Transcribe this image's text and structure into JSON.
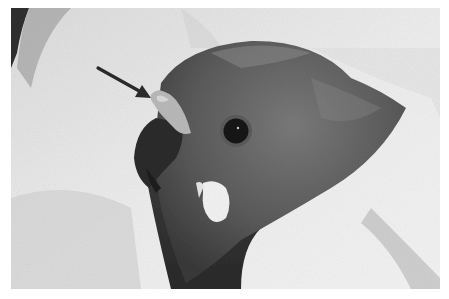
{
  "image": {
    "kind": "photograph",
    "tone": "grayscale",
    "subject": "parrot head wrapped in towel",
    "annotation": {
      "type": "arrow",
      "points_to": "cere-lesion",
      "color": "#2a2a2a"
    }
  },
  "colors": {
    "background": "#ffffff",
    "towel_light": "#ececec",
    "towel_shadow": "#c9c9c9",
    "head_dark": "#4a4a4a",
    "head_mid": "#6a6a6a",
    "beak": "#2b2b2b",
    "eye": "#151515",
    "cheek_patch": "#f2f2f2"
  }
}
